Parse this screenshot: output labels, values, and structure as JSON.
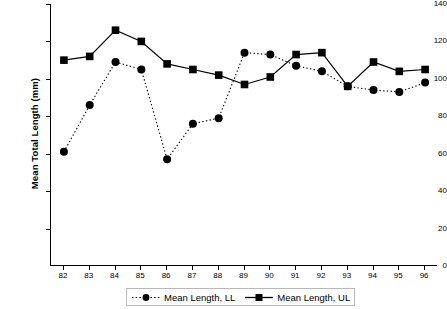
{
  "chart_data": {
    "type": "line",
    "title": "",
    "xlabel": "",
    "ylabel": "Mean Total Length (mm)",
    "categories": [
      "82",
      "83",
      "84",
      "85",
      "86",
      "87",
      "88",
      "89",
      "90",
      "91",
      "92",
      "93",
      "94",
      "95",
      "96"
    ],
    "ylim": [
      0,
      140
    ],
    "yticks": [
      0,
      20,
      40,
      60,
      80,
      100,
      120,
      140
    ],
    "ytick_labels": [
      "0",
      "20",
      "40",
      "60",
      "80",
      "100",
      "120",
      "140"
    ],
    "grid": false,
    "legend_position": "bottom",
    "series": [
      {
        "name": "Mean Length, LL",
        "marker": "circle",
        "line_style": "dotted",
        "color": "#000000",
        "values": [
          61,
          86,
          109,
          105,
          57,
          76,
          79,
          114,
          113,
          107,
          104,
          96,
          94,
          93,
          98
        ]
      },
      {
        "name": "Mean Length, UL",
        "marker": "square",
        "line_style": "solid",
        "color": "#000000",
        "values": [
          110,
          112,
          126,
          120,
          108,
          105,
          102,
          97,
          101,
          113,
          114,
          96,
          109,
          104,
          105
        ]
      }
    ]
  },
  "legend": {
    "items": [
      {
        "label": "Mean Length, LL"
      },
      {
        "label": "Mean Length, UL"
      }
    ]
  }
}
